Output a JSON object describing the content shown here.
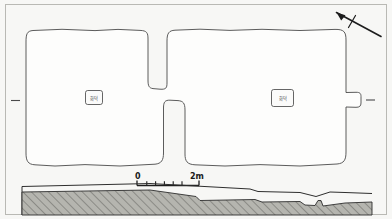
{
  "figure": {
    "kind": "archaeological-site-plan",
    "background_color": "#f7f7f5",
    "ink_color": "#4a4a4a",
    "border_color": "#b9b9b4"
  },
  "plan": {
    "chambers": [
      {
        "id": "left-chamber",
        "label": "화덕"
      },
      {
        "id": "right-chamber",
        "label": "화덕"
      }
    ]
  },
  "north_arrow": {
    "name": "north-arrow",
    "direction": "up-left"
  },
  "scale_bar": {
    "start_label": "0",
    "end_label": "2m",
    "tick_count": 6
  },
  "section": {
    "hatch_color": "#8f8f8a",
    "fill_color": "#b3b3ad"
  }
}
